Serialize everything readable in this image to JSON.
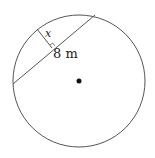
{
  "diagram": {
    "type": "circle-chord-geometry",
    "circle": {
      "cx": 79,
      "cy": 81,
      "r": 66,
      "stroke": "#555555"
    },
    "center_point": {
      "cx": 79,
      "cy": 81,
      "r": 2.5,
      "fill": "#111111"
    },
    "chord": {
      "x1": 13,
      "y1": 84,
      "x2": 95,
      "y2": 15,
      "stroke": "#555555"
    },
    "perpendicular": {
      "x1": 37,
      "y1": 29,
      "x2": 52,
      "y2": 48,
      "stroke": "#555555"
    },
    "right_angle_marker": true,
    "labels": {
      "distance": "x",
      "length": "8 m"
    }
  }
}
